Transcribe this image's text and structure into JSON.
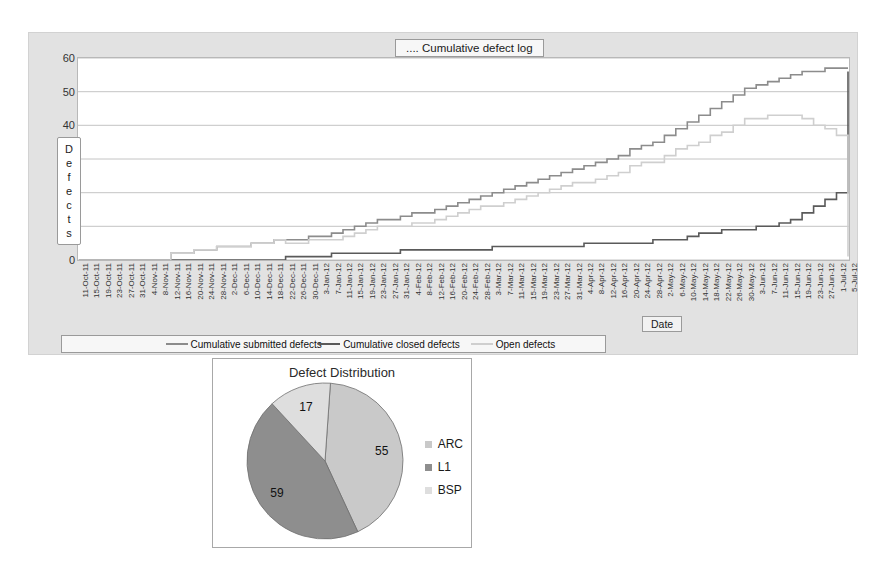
{
  "line_chart": {
    "title": ".... Cumulative defect log",
    "y_axis_title_letters": [
      "D",
      "e",
      "f",
      "e",
      "c",
      "t",
      "s"
    ],
    "y_axis_title": "Defects",
    "x_axis_title": "Date",
    "y_ticks": [
      60,
      50,
      40,
      30,
      20,
      10,
      0
    ],
    "legend": [
      {
        "label": "Cumulative submitted defects",
        "color": "#8c8c8c"
      },
      {
        "label": "Cumulative closed defects",
        "color": "#5a5a5a"
      },
      {
        "label": "Open defects",
        "color": "#cfcfcf"
      }
    ]
  },
  "pie_chart": {
    "title": "Defect Distribution",
    "legend": [
      {
        "label": "ARC",
        "color": "#c9c9c9"
      },
      {
        "label": "L1",
        "color": "#8e8e8e"
      },
      {
        "label": "BSP",
        "color": "#dedede"
      }
    ]
  },
  "chart_data": [
    {
      "type": "line",
      "title": ".... Cumulative defect log",
      "xlabel": "Date",
      "ylabel": "Defects",
      "ylim": [
        0,
        60
      ],
      "y_ticks": [
        0,
        10,
        20,
        30,
        40,
        50,
        60
      ],
      "grid": true,
      "legend_position": "bottom",
      "categories": [
        "11-Oct-11",
        "15-Oct-11",
        "19-Oct-11",
        "23-Oct-11",
        "27-Oct-11",
        "31-Oct-11",
        "4-Nov-11",
        "8-Nov-11",
        "12-Nov-11",
        "16-Nov-11",
        "20-Nov-11",
        "24-Nov-11",
        "28-Nov-11",
        "2-Dec-11",
        "6-Dec-11",
        "10-Dec-11",
        "14-Dec-11",
        "18-Dec-11",
        "22-Dec-11",
        "26-Dec-11",
        "30-Dec-11",
        "3-Jan-12",
        "7-Jan-12",
        "11-Jan-12",
        "15-Jan-12",
        "19-Jan-12",
        "23-Jan-12",
        "27-Jan-12",
        "31-Jan-12",
        "4-Feb-12",
        "8-Feb-12",
        "12-Feb-12",
        "16-Feb-12",
        "20-Feb-12",
        "24-Feb-12",
        "28-Feb-12",
        "3-Mar-12",
        "7-Mar-12",
        "11-Mar-12",
        "15-Mar-12",
        "19-Mar-12",
        "23-Mar-12",
        "27-Mar-12",
        "31-Mar-12",
        "4-Apr-12",
        "8-Apr-12",
        "12-Apr-12",
        "16-Apr-12",
        "20-Apr-12",
        "24-Apr-12",
        "28-Apr-12",
        "2-May-12",
        "6-May-12",
        "10-May-12",
        "14-May-12",
        "18-May-12",
        "22-May-12",
        "26-May-12",
        "30-May-12",
        "3-Jun-12",
        "7-Jun-12",
        "11-Jun-12",
        "15-Jun-12",
        "19-Jun-12",
        "23-Jun-12",
        "27-Jun-12",
        "1-Jul-12",
        "5-Jul-12"
      ],
      "series": [
        {
          "name": "Cumulative submitted defects",
          "color": "#8c8c8c",
          "values": [
            0,
            0,
            0,
            0,
            0,
            0,
            0,
            0,
            2,
            2,
            3,
            3,
            4,
            4,
            4,
            5,
            5,
            6,
            6,
            6,
            7,
            7,
            8,
            9,
            10,
            11,
            12,
            12,
            13,
            14,
            14,
            15,
            16,
            17,
            18,
            19,
            20,
            21,
            22,
            23,
            24,
            25,
            26,
            27,
            28,
            29,
            30,
            31,
            33,
            34,
            35,
            37,
            39,
            41,
            43,
            45,
            47,
            49,
            51,
            52,
            53,
            54,
            55,
            56,
            56,
            57,
            57,
            57
          ]
        },
        {
          "name": "Cumulative closed defects",
          "color": "#5a5a5a",
          "values": [
            0,
            0,
            0,
            0,
            0,
            0,
            0,
            0,
            0,
            0,
            0,
            0,
            0,
            0,
            0,
            0,
            0,
            0,
            1,
            1,
            1,
            1,
            2,
            2,
            2,
            2,
            2,
            2,
            3,
            3,
            3,
            3,
            3,
            3,
            3,
            3,
            4,
            4,
            4,
            4,
            4,
            4,
            4,
            4,
            5,
            5,
            5,
            5,
            5,
            5,
            6,
            6,
            6,
            7,
            8,
            8,
            9,
            9,
            9,
            10,
            10,
            11,
            12,
            14,
            16,
            18,
            20,
            56
          ]
        },
        {
          "name": "Open defects",
          "color": "#cfcfcf",
          "values": [
            0,
            0,
            0,
            0,
            0,
            0,
            0,
            0,
            2,
            2,
            3,
            3,
            4,
            4,
            4,
            5,
            5,
            6,
            5,
            5,
            6,
            6,
            6,
            7,
            8,
            9,
            10,
            10,
            10,
            11,
            11,
            12,
            13,
            14,
            15,
            16,
            16,
            17,
            18,
            19,
            20,
            21,
            22,
            23,
            23,
            24,
            25,
            26,
            28,
            29,
            29,
            31,
            33,
            34,
            35,
            37,
            38,
            40,
            42,
            42,
            43,
            43,
            43,
            42,
            40,
            39,
            37,
            1
          ]
        }
      ]
    },
    {
      "type": "pie",
      "title": "Defect Distribution",
      "labels": [
        "ARC",
        "L1",
        "BSP"
      ],
      "values": [
        55,
        59,
        17
      ],
      "colors": [
        "#c9c9c9",
        "#8e8e8e",
        "#dedede"
      ],
      "legend_position": "right",
      "total": 131
    }
  ]
}
